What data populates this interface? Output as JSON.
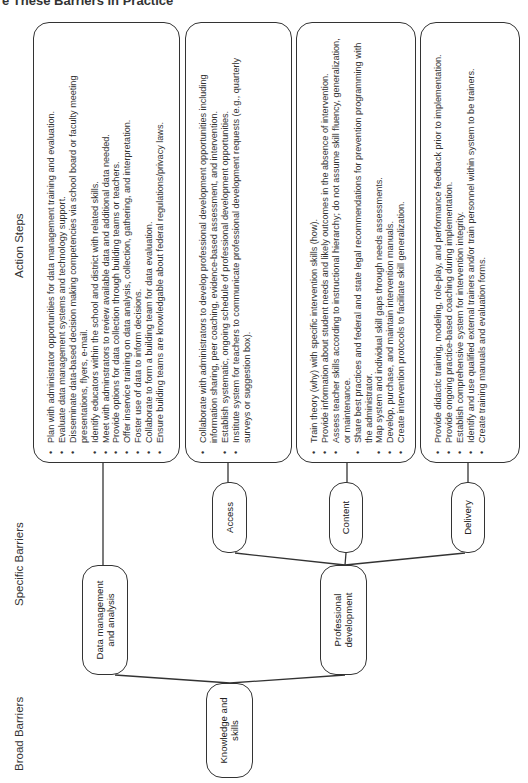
{
  "title": "e These Barriers in Practice",
  "headers": {
    "action_steps": "Action Steps",
    "specific_barriers": "Specific Barriers",
    "broad_barriers": "Broad Barriers"
  },
  "broad_barriers": [
    {
      "label": "Knowledge and skills"
    }
  ],
  "specific_barriers": [
    {
      "label": "Data management and analysis",
      "parent": "Knowledge and skills"
    },
    {
      "label": "Professional development",
      "parent": "Knowledge and skills"
    }
  ],
  "sub_barriers": [
    {
      "label": "Access",
      "parent": "Professional development"
    },
    {
      "label": "Content",
      "parent": "Professional development"
    },
    {
      "label": "Delivery",
      "parent": "Professional development"
    }
  ],
  "action_steps": [
    {
      "for": "Data management and analysis",
      "items": [
        "Plan with administrator opportunities for data management training and evaluation.",
        "Evaluate data management systems and technology support.",
        "Disseminate data-based decision making competencies via school board or faculty meeting presentations, flyers, e-mail.",
        "Identify educators within the school and district with related skills.",
        "Meet with adminstrators to review available data and additional data needed.",
        "Provide options for data collection through building teams or teachers.",
        "Offer inservice training on data analysis, collection, gathering, and interpretation.",
        "Foster use of data to inform decisions.",
        "Collaborate to form a building team for data evaluation.",
        "Ensure building teams are knowledgable about federal regulations/privacy laws."
      ]
    },
    {
      "for": "Access",
      "items": [
        "Collaborate with administrators to develop professional development opportunities including information sharing, peer coaching, evidence-based assessment, and intervention.",
        "Establish systematic, ongoing schedule of professional development opportunities.",
        "Institute system for teachers to communicate professional development requests (e.g., quarterly surveys or suggestion box)."
      ]
    },
    {
      "for": "Content",
      "items": [
        "Train theory (why) with specific intervention skills (how).",
        "Provide information about student needs and likely outcomes in the absence of intervention.",
        "Assess teacher skills according to instructional hierarchy; do not assume skill fluency, generalization, or maintenance.",
        "Share best practices and federal and state legal recommendations for prevention programming with the administrator.",
        "Map system and individual skill gaps through needs assessments.",
        "Develop, purchase, and maintain intervention manuals.",
        "Create intervention protocols to facilitate skill generalization."
      ]
    },
    {
      "for": "Delivery",
      "items": [
        "Provide didactic training, modeling, role-play, and performance feedback prior to implementation.",
        "Provide ongoing practice-based coaching during implementation.",
        "Establish comprehensive system for intervention integrity.",
        "Identify and use qualified external trainers and/or train personnel within system to be trainers.",
        "Create training manuals and evaluation forms."
      ]
    }
  ],
  "colors": {
    "line": "#333333",
    "text": "#222222",
    "background": "#ffffff"
  }
}
